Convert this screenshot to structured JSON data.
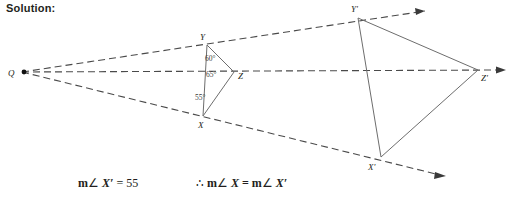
{
  "heading": {
    "text": "Solution:"
  },
  "figure": {
    "type": "dilation-diagram",
    "center_label": "Q",
    "line_color": "#6d6d6d",
    "dash_color": "#4a4a4a",
    "text_color": "#231f20",
    "preimage": {
      "name": "triangle-XYZ",
      "vertices": [
        {
          "label": "Y",
          "x": 207,
          "y": 45,
          "label_x": 200,
          "label_y": 39
        },
        {
          "label": "Z",
          "x": 234,
          "y": 72,
          "label_x": 238,
          "label_y": 79
        },
        {
          "label": "X",
          "x": 203,
          "y": 116,
          "label_x": 198,
          "label_y": 127
        }
      ],
      "angles": [
        {
          "value": "60°",
          "x": 212,
          "y": 59
        },
        {
          "value": "65°",
          "x": 210,
          "y": 74
        },
        {
          "value": "55°",
          "x": 201,
          "y": 98
        }
      ]
    },
    "image": {
      "name": "triangle-X-prime-Y-prime-Z-prime",
      "vertices": [
        {
          "label": "Y′",
          "x": 358,
          "y": 18,
          "label_x": 352,
          "label_y": 11
        },
        {
          "label": "Z′",
          "x": 478,
          "y": 70,
          "label_x": 481,
          "label_y": 80
        },
        {
          "label": "X′",
          "x": 381,
          "y": 157,
          "label_x": 369,
          "label_y": 169
        }
      ]
    },
    "rays": [
      {
        "name": "ray-Q-through-Y",
        "from_x": 22,
        "from_y": 72,
        "to_x": 432,
        "to_y": 10
      },
      {
        "name": "ray-Q-through-Z",
        "from_x": 22,
        "from_y": 72,
        "to_x": 506,
        "to_y": 70
      },
      {
        "name": "ray-Q-through-X",
        "from_x": 22,
        "from_y": 72,
        "to_x": 446,
        "to_y": 176
      }
    ],
    "center_point": {
      "x": 22,
      "y": 72,
      "label_x": 10,
      "label_y": 76
    }
  },
  "statements": {
    "left": {
      "m": "m",
      "angle_sign": "∠",
      "subject": "X′",
      "equals": "=",
      "value": "55"
    },
    "right": {
      "therefore": "∴",
      "m1": "m",
      "angle_sign1": "∠",
      "subject1": "X",
      "equals": "=",
      "m2": "m",
      "angle_sign2": "∠",
      "subject2": "X′"
    }
  }
}
